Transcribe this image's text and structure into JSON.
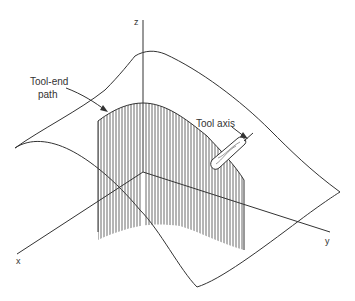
{
  "figure": {
    "type": "3D machining diagram",
    "labels": {
      "tool_end_path": [
        "Tool-end",
        "path"
      ],
      "tool_axis": "Tool axis"
    },
    "axes": {
      "x": "x",
      "y": "y",
      "z": "z"
    },
    "colors": {
      "line": "#333333",
      "background": "#ffffff"
    }
  }
}
